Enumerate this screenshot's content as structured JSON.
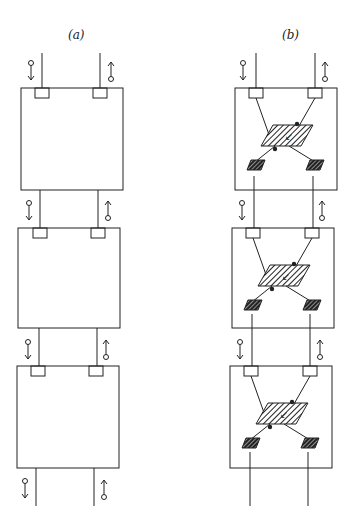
{
  "panels": [
    {
      "id": "a",
      "label": "(a)",
      "blocks": 3,
      "internal_structure": false
    },
    {
      "id": "b",
      "label": "(b)",
      "blocks": 3,
      "internal_structure": true,
      "central_element_glyph": "↙",
      "small_element_glyph": "T"
    }
  ],
  "colors": {
    "stroke": "#222222",
    "background": "#ffffff"
  },
  "signals": {
    "left_arrow": "down-arrow-with-circle",
    "right_arrow": "up-arrow-with-circle"
  }
}
